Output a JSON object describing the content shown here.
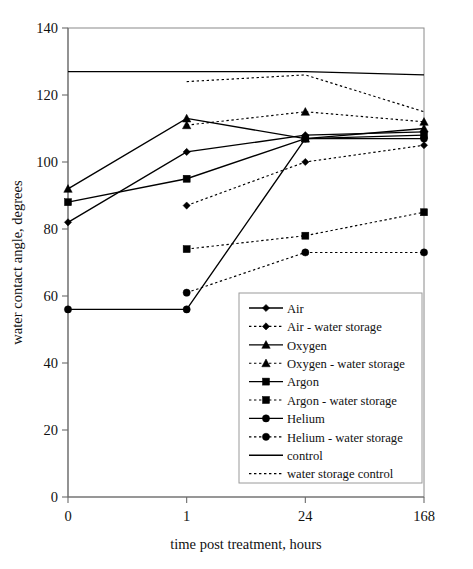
{
  "chart_data": {
    "type": "line",
    "title": "",
    "xlabel": "time post treatment, hours",
    "ylabel": "water contact angle, degrees",
    "categories": [
      "0",
      "1",
      "24",
      "168"
    ],
    "x_tick_labels": [
      "0",
      "1",
      "24",
      "168"
    ],
    "y_tick_labels": [
      "0",
      "20",
      "40",
      "60",
      "80",
      "100",
      "120",
      "140"
    ],
    "ylim": [
      0,
      140
    ],
    "ytick_step": 20,
    "grid": false,
    "legend_position": "inside-lower-right",
    "axis_note": "x axis is categorical / evenly spaced",
    "series": [
      {
        "name": "Air",
        "style": "solid",
        "marker": "diamond",
        "values": [
          82,
          103,
          108,
          109
        ]
      },
      {
        "name": "Air - water storage",
        "style": "dotted",
        "marker": "diamond",
        "values": [
          null,
          87,
          100,
          105
        ]
      },
      {
        "name": "Oxygen",
        "style": "solid",
        "marker": "triangle",
        "values": [
          92,
          113,
          107,
          110
        ]
      },
      {
        "name": "Oxygen - water storage",
        "style": "dotted",
        "marker": "triangle",
        "values": [
          null,
          111,
          115,
          112
        ]
      },
      {
        "name": "Argon",
        "style": "solid",
        "marker": "square",
        "values": [
          88,
          95,
          107,
          108
        ]
      },
      {
        "name": "Argon - water storage",
        "style": "dotted",
        "marker": "square",
        "values": [
          null,
          74,
          78,
          85
        ]
      },
      {
        "name": "Helium",
        "style": "solid",
        "marker": "circle",
        "values": [
          56,
          56,
          107,
          107
        ]
      },
      {
        "name": "Helium - water storage",
        "style": "dotted",
        "marker": "circle",
        "values": [
          null,
          61,
          73,
          73
        ]
      },
      {
        "name": "control",
        "style": "solid",
        "marker": "none",
        "values": [
          127,
          127,
          127,
          126
        ]
      },
      {
        "name": "water storage control",
        "style": "dotted",
        "marker": "none",
        "values": [
          null,
          124,
          126,
          115
        ]
      }
    ]
  },
  "legend": {
    "items": [
      {
        "label": "Air",
        "style": "solid",
        "marker": "diamond"
      },
      {
        "label": "Air - water storage",
        "style": "dotted",
        "marker": "diamond"
      },
      {
        "label": "Oxygen",
        "style": "solid",
        "marker": "triangle"
      },
      {
        "label": "Oxygen - water storage",
        "style": "dotted",
        "marker": "triangle"
      },
      {
        "label": "Argon",
        "style": "solid",
        "marker": "square"
      },
      {
        "label": "Argon - water storage",
        "style": "dotted",
        "marker": "square"
      },
      {
        "label": "Helium",
        "style": "solid",
        "marker": "circle"
      },
      {
        "label": "Helium - water storage",
        "style": "dotted",
        "marker": "circle"
      },
      {
        "label": "control",
        "style": "solid",
        "marker": "none"
      },
      {
        "label": "water storage control",
        "style": "dotted",
        "marker": "none"
      }
    ]
  },
  "colors": {
    "ink": "#000000",
    "axis": "#6b6b6b",
    "frame": "#8a8a8a",
    "background": "#ffffff"
  }
}
